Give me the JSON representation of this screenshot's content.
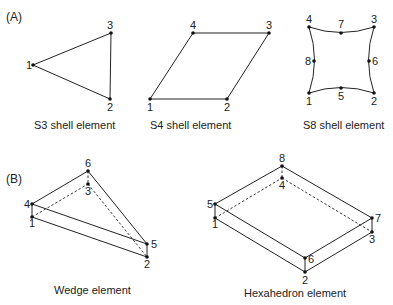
{
  "panels": {
    "A": {
      "label": "(A)"
    },
    "B": {
      "label": "(B)"
    }
  },
  "elements": {
    "s3": {
      "caption": "S3 shell element",
      "nodes": [
        {
          "id": "1",
          "x": 33,
          "y": 65,
          "label": "1"
        },
        {
          "id": "2",
          "x": 110,
          "y": 99,
          "label": "2"
        },
        {
          "id": "3",
          "x": 111,
          "y": 33,
          "label": "3"
        }
      ]
    },
    "s4": {
      "caption": "S4 shell element",
      "nodes": [
        {
          "id": "1",
          "x": 150,
          "y": 99,
          "label": "1"
        },
        {
          "id": "2",
          "x": 227,
          "y": 99,
          "label": "2"
        },
        {
          "id": "3",
          "x": 269,
          "y": 33,
          "label": "3"
        },
        {
          "id": "4",
          "x": 193,
          "y": 33,
          "label": "4"
        }
      ]
    },
    "s8": {
      "caption": "S8 shell element",
      "nodes": [
        {
          "id": "1",
          "x": 309,
          "y": 93,
          "label": "1"
        },
        {
          "id": "2",
          "x": 374,
          "y": 93,
          "label": "2"
        },
        {
          "id": "3",
          "x": 374,
          "y": 27,
          "label": "3"
        },
        {
          "id": "4",
          "x": 309,
          "y": 27,
          "label": "4"
        },
        {
          "id": "5",
          "x": 341,
          "y": 88,
          "label": "5"
        },
        {
          "id": "6",
          "x": 369,
          "y": 61,
          "label": "6"
        },
        {
          "id": "7",
          "x": 341,
          "y": 33,
          "label": "7"
        },
        {
          "id": "8",
          "x": 314,
          "y": 61,
          "label": "8"
        }
      ]
    },
    "wedge": {
      "caption": "Wedge element",
      "nodes": [
        {
          "id": "1",
          "x": 32,
          "y": 217,
          "label": "1"
        },
        {
          "id": "2",
          "x": 147,
          "y": 257,
          "label": "2"
        },
        {
          "id": "3",
          "x": 88,
          "y": 184,
          "label": "3"
        },
        {
          "id": "4",
          "x": 32,
          "y": 204,
          "label": "4"
        },
        {
          "id": "5",
          "x": 147,
          "y": 244,
          "label": "5"
        },
        {
          "id": "6",
          "x": 88,
          "y": 171,
          "label": "6"
        }
      ]
    },
    "hex": {
      "caption": "Hexahedron element",
      "nodes": [
        {
          "id": "1",
          "x": 215,
          "y": 218,
          "label": "1"
        },
        {
          "id": "2",
          "x": 305,
          "y": 272,
          "label": "2"
        },
        {
          "id": "3",
          "x": 372,
          "y": 232,
          "label": "3"
        },
        {
          "id": "4",
          "x": 282,
          "y": 178,
          "label": "4"
        },
        {
          "id": "5",
          "x": 215,
          "y": 204,
          "label": "5"
        },
        {
          "id": "6",
          "x": 305,
          "y": 258,
          "label": "6"
        },
        {
          "id": "7",
          "x": 372,
          "y": 218,
          "label": "7"
        },
        {
          "id": "8",
          "x": 282,
          "y": 166,
          "label": "8"
        }
      ]
    }
  }
}
